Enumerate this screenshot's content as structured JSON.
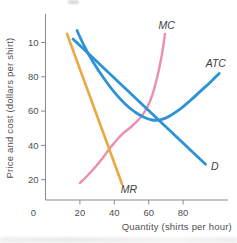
{
  "chart_data": {
    "type": "line",
    "title": "",
    "xlabel": "Quantity (shirts per hour)",
    "ylabel": "Price and cost (dollars per shirt)",
    "xlim": [
      0,
      106
    ],
    "ylim": [
      0,
      117
    ],
    "grid": false,
    "legend_position": "inline-curve-labels",
    "colors": {
      "axis": "#8a8a8a",
      "tick_text": "#4f4f4f",
      "curve_label": "#3d3d3d"
    },
    "x_ticks": [
      {
        "value": 0,
        "label": "0",
        "tick": false,
        "dx": -12
      },
      {
        "value": 20,
        "label": "20"
      },
      {
        "value": 40,
        "label": "40"
      },
      {
        "value": 60,
        "label": "60"
      },
      {
        "value": 80,
        "label": "80"
      }
    ],
    "y_ticks": [
      {
        "value": 20,
        "label": "20"
      },
      {
        "value": 40,
        "label": "40"
      },
      {
        "value": 60,
        "label": "60"
      },
      {
        "value": 80,
        "label": "80"
      },
      {
        "value": 100,
        "label": "10"
      }
    ],
    "series": [
      {
        "name": "MC",
        "label": "MC",
        "color": "#ec8fad",
        "width": 2.4,
        "label_pos": [
          70.5,
          110
        ],
        "points": [
          [
            20,
            18
          ],
          [
            26,
            24
          ],
          [
            32,
            31
          ],
          [
            38,
            39
          ],
          [
            44,
            46
          ],
          [
            50,
            51
          ],
          [
            55,
            56
          ],
          [
            59,
            62
          ],
          [
            62,
            69
          ],
          [
            65,
            80
          ],
          [
            67.5,
            92
          ],
          [
            69.5,
            105
          ]
        ]
      },
      {
        "name": "ATC",
        "label": "ATC",
        "color": "#2d93d6",
        "width": 2.8,
        "label_pos": [
          99,
          88
        ],
        "points": [
          [
            18.3,
            107
          ],
          [
            23,
            97
          ],
          [
            28,
            88
          ],
          [
            34,
            79
          ],
          [
            40,
            71
          ],
          [
            46,
            64.5
          ],
          [
            52,
            59.5
          ],
          [
            57,
            56.5
          ],
          [
            62,
            54.8
          ],
          [
            67,
            55
          ],
          [
            72,
            57
          ],
          [
            78,
            61
          ],
          [
            84,
            66
          ],
          [
            90,
            71.5
          ],
          [
            96,
            77
          ],
          [
            101,
            82
          ]
        ]
      },
      {
        "name": "D",
        "label": "D",
        "color": "#2d93d6",
        "width": 2.8,
        "label_pos": [
          98.5,
          27.5
        ],
        "points": [
          [
            16,
            102
          ],
          [
            93,
            29
          ]
        ]
      },
      {
        "name": "MR",
        "label": "MR",
        "color": "#eaa83e",
        "width": 2.6,
        "label_pos": [
          48.5,
          14
        ],
        "points": [
          [
            12.5,
            105
          ],
          [
            44.5,
            17.5
          ]
        ]
      }
    ]
  }
}
